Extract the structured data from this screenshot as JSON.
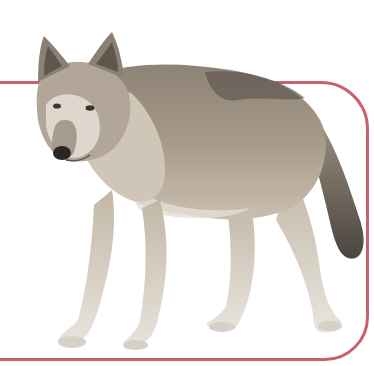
{
  "image": {
    "subject": "gray wolf standing, facing left, looking toward viewer",
    "alt": "Gray wolf standing on white background with a pink rounded frame"
  },
  "colors": {
    "background": "#ffffff",
    "frame": "#c8606e",
    "fur_main": "#a09383",
    "fur_dark": "#6e665c",
    "fur_light": "#d9d3ca",
    "fur_belly": "#e6e1d8",
    "nose": "#2a2826"
  }
}
